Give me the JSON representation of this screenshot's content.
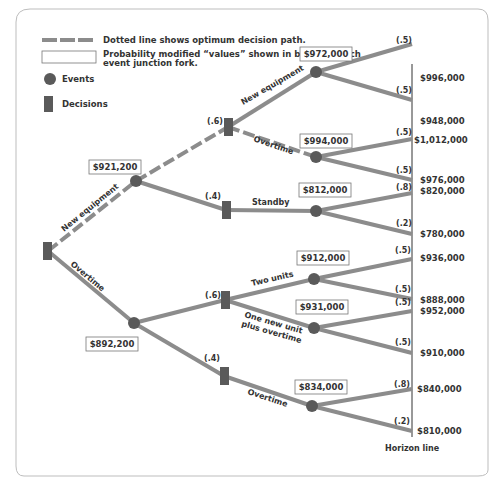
{
  "legend": {
    "dotted_line": "Dotted line shows optimum decision path.",
    "box_line1": "Probability modified “values” shown in boxes at each",
    "box_line2": "event junction fork.",
    "events": "Events",
    "decisions": "Decisions"
  },
  "colors": {
    "line": "#8c8c8c",
    "node": "#5a5a5a",
    "text": "#333333",
    "frame": "#b0b0b0"
  },
  "tree": {
    "root_branches": {
      "upper": "New equipment",
      "lower": "Overtime"
    },
    "event_values": {
      "upper": "$921,200",
      "lower": "$892,200",
      "ne_ne": "$972,000",
      "ne_ot": "$994,000",
      "ne_sb": "$812,000",
      "ot_two": "$912,000",
      "ot_one": "$931,000",
      "ot_ot": "$834,000"
    },
    "branch_labels": {
      "new_equipment": "New equipment",
      "overtime": "Overtime",
      "standby": "Standby",
      "two_units": "Two units",
      "one_new_l1": "One new unit",
      "one_new_l2": "plus overtime",
      "overtime2": "Overtime"
    },
    "probabilities": {
      "p_upper_hi": "(.6)",
      "p_upper_lo": "(.4)",
      "p_lower_hi": "(.6)",
      "p_lower_lo": "(.4)",
      "o1a": "(.5)",
      "o1b": "(.5)",
      "o2a": "(.5)",
      "o2b": "(.5)",
      "o3a": "(.8)",
      "o3b": "(.2)",
      "o4a": "(.5)",
      "o4b": "(.5)",
      "o5a": "(.5)",
      "o5b": "(.5)",
      "o6a": "(.8)",
      "o6b": "(.2)"
    },
    "outcomes": [
      "$996,000",
      "$948,000",
      "$1,012,000",
      "$976,000",
      "$820,000",
      "$780,000",
      "$936,000",
      "$888,000",
      "$952,000",
      "$910,000",
      "$840,000",
      "$810,000"
    ],
    "horizon": "Horizon line"
  }
}
